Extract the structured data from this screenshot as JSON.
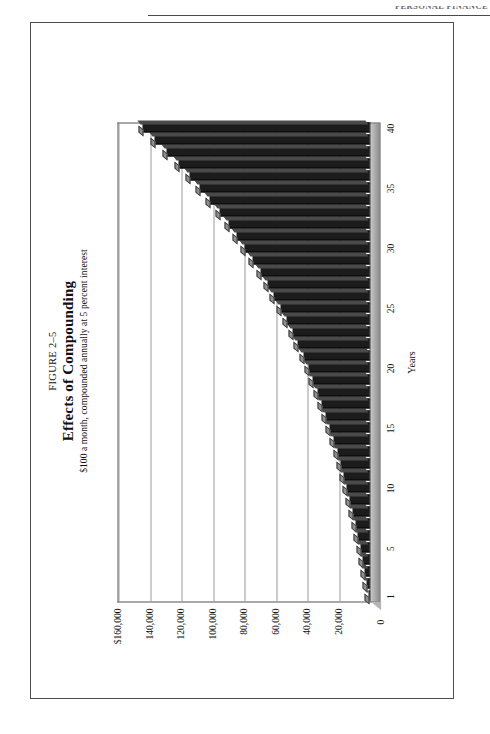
{
  "page": {
    "running_head": "PERSONAL FINANCE"
  },
  "figure": {
    "number": "FIGURE 2–5",
    "title": "Effects of Compounding",
    "subtitle": "$100 a month, compounded annually at 5 percent interest"
  },
  "chart_data": {
    "type": "bar",
    "title": "Effects of Compounding",
    "subtitle": "$100 a month, compounded annually at 5 percent interest",
    "xlabel": "Years",
    "ylabel": "",
    "ylim": [
      0,
      160000
    ],
    "grid": true,
    "legend": "none",
    "ytick_labels": [
      "$160,000",
      "140,000",
      "120,000",
      "100,000",
      "80,000",
      "60,000",
      "40,000",
      "20,000",
      "0"
    ],
    "ytick_values": [
      160000,
      140000,
      120000,
      100000,
      80000,
      60000,
      40000,
      20000,
      0
    ],
    "xtick_labels": [
      "1",
      "5",
      "10",
      "15",
      "20",
      "25",
      "30",
      "35",
      "40"
    ],
    "xtick_values": [
      1,
      5,
      10,
      15,
      20,
      25,
      30,
      35,
      40
    ],
    "categories": [
      1,
      2,
      3,
      4,
      5,
      6,
      7,
      8,
      9,
      10,
      11,
      12,
      13,
      14,
      15,
      16,
      17,
      18,
      19,
      20,
      21,
      22,
      23,
      24,
      25,
      26,
      27,
      28,
      29,
      30,
      31,
      32,
      33,
      34,
      35,
      36,
      37,
      38,
      39,
      40
    ],
    "values": [
      1200,
      2460,
      3783,
      5172,
      6631,
      8162,
      9771,
      11459,
      13232,
      15094,
      17048,
      19101,
      21256,
      23519,
      25895,
      28389,
      31009,
      33759,
      36647,
      39680,
      42864,
      46207,
      49717,
      53403,
      57273,
      61337,
      65604,
      70084,
      74788,
      79728,
      84914,
      90360,
      96078,
      102082,
      108386,
      115005,
      121955,
      129253,
      136916,
      144962
    ],
    "bar_color": "#1c1c1c",
    "bar_top_color": "#8f8f8f"
  }
}
